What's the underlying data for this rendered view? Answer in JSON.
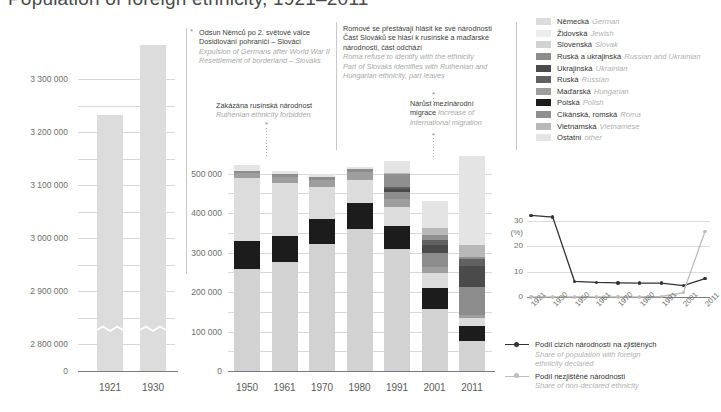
{
  "title": "Population of foreign ethnicity, 1921–2011",
  "left_chart": {
    "y_ticks": [
      "3 300 000",
      "3 200 000",
      "3 100 000",
      "3 000 000",
      "2 900 000",
      "2 800 000",
      "0"
    ],
    "x_ticks": [
      "1921",
      "1930"
    ]
  },
  "middle_chart": {
    "y_ticks": [
      "500 000",
      "400 000",
      "300 000",
      "200 000",
      "100 000",
      "0"
    ],
    "x_ticks": [
      "1950",
      "1961",
      "1970",
      "1980",
      "1991",
      "2001",
      "2011"
    ]
  },
  "annotations": [
    {
      "id": "expulsion",
      "cs": [
        "Odsun Němců po 2. světové válce",
        "Dosidlování pohraničí – Slováci"
      ],
      "en": [
        "Expulsion of Germans after World War II",
        "Resettlement of borderland – Slovaks"
      ]
    },
    {
      "id": "ruthenian",
      "cs": [
        "Zakázána rusínská národnost"
      ],
      "en": [
        "Ruthenian ethnicity forbidden"
      ]
    },
    {
      "id": "roma-slovaks",
      "cs": [
        "Romové se přestávají hlásit ke své národnosti",
        "Část Slováků se hlásí k rusínské a maďarské",
        "národnosti, část odchází"
      ],
      "en": [
        "Roma refuse to identify with the ethnicity",
        "Part of Slovaks identifies with Ruthenian and",
        "Hungarian ethnicity, part leaves"
      ]
    },
    {
      "id": "migration",
      "cs": [
        "Nárůst mezinárodní"
      ],
      "cs2": "migrace",
      "en": [
        "Increase of",
        "international migration"
      ]
    }
  ],
  "ethnicity_legend": [
    {
      "cs": "Německá",
      "en": "German",
      "color": "#dcdcdc"
    },
    {
      "cs": "Židovská",
      "en": "Jewish",
      "color": "#ececec"
    },
    {
      "cs": "Slovenská",
      "en": "Slovak",
      "color": "#d2d2d2"
    },
    {
      "cs": "Ruská a ukrajinská",
      "en": "Russian and Ukrainian",
      "color": "#8c8c8c"
    },
    {
      "cs": "Ukrajinská",
      "en": "Ukrainian",
      "color": "#4a4a4a"
    },
    {
      "cs": "Ruská",
      "en": "Russian",
      "color": "#616161"
    },
    {
      "cs": "Maďarská",
      "en": "Hungarian",
      "color": "#9e9e9e"
    },
    {
      "cs": "Polská",
      "en": "Polish",
      "color": "#1c1c1c"
    },
    {
      "cs": "Cikánská, romská",
      "en": "Roma",
      "color": "#8f8f8f"
    },
    {
      "cs": "Vietnamská",
      "en": "Vietnamese",
      "color": "#b8b8b8"
    },
    {
      "cs": "Ostatní",
      "en": "other",
      "color": "#e4e4e4"
    }
  ],
  "line_chart": {
    "y_ticks": [
      "30",
      "20",
      "10",
      "0"
    ],
    "y_unit": "(%)",
    "x_ticks": [
      "1921",
      "1930",
      "1950",
      "1961",
      "1970",
      "1980",
      "1991",
      "2001",
      "2011"
    ],
    "legend": [
      {
        "cs": "Podíl cizích národností na zjištěných",
        "en": [
          "Share of population with foreign",
          "ethnicity declared"
        ],
        "color": "#333333"
      },
      {
        "cs": "Podíl nezjištěné národnosti",
        "en": [
          "Share of non-declared ethnicity"
        ],
        "color": "#bdbdbd"
      }
    ]
  },
  "chart_data": [
    {
      "type": "bar",
      "id": "left-stacked-bars",
      "title": "Population of foreign ethnicity, 1921–1930",
      "xlabel": "",
      "ylabel": "",
      "ylim": [
        2750000,
        3370000
      ],
      "axis_break": true,
      "grid": true,
      "categories": [
        "1921",
        "1930"
      ],
      "stack_order": [
        "Ostatní",
        "Vietnamská",
        "Cikánská, romská",
        "Polská",
        "Maďarská",
        "Ruská",
        "Ukrajinská",
        "Ruská a ukrajinská",
        "Slovenská",
        "Židovská",
        "Německá"
      ],
      "series": [
        {
          "name": "Ostatní",
          "values": [
            3063000,
            3150000
          ]
        },
        {
          "name": "Vietnamská",
          "values": [
            0,
            0
          ]
        },
        {
          "name": "Cikánská, romská",
          "values": [
            1000,
            1500
          ]
        },
        {
          "name": "Polská",
          "values": [
            104000,
            93000
          ]
        },
        {
          "name": "Maďarská",
          "values": [
            8000,
            12000
          ]
        },
        {
          "name": "Ruská",
          "values": [
            0,
            0
          ]
        },
        {
          "name": "Ukrajinská",
          "values": [
            0,
            0
          ]
        },
        {
          "name": "Ruská a ukrajinská",
          "values": [
            14000,
            23000
          ]
        },
        {
          "name": "Slovenská",
          "values": [
            16000,
            44000
          ]
        },
        {
          "name": "Židovská",
          "values": [
            11000,
            10000
          ]
        },
        {
          "name": "Německá",
          "values": [
            3123000,
            3150000
          ]
        }
      ],
      "totals": [
        3232000,
        3365000
      ]
    },
    {
      "type": "bar",
      "id": "middle-stacked-bars",
      "title": "Population of foreign ethnicity, 1950–2011",
      "xlabel": "",
      "ylabel": "",
      "ylim": [
        0,
        560000
      ],
      "grid": true,
      "categories": [
        "1950",
        "1961",
        "1970",
        "1980",
        "1991",
        "2001",
        "2011"
      ],
      "totals": [
        521000,
        508000,
        500000,
        517000,
        532000,
        432000,
        546000
      ],
      "series": [
        {
          "name": "Slovenská",
          "values": [
            258000,
            276000,
            321000,
            360000,
            314000,
            193000,
            147000
          ]
        },
        {
          "name": "Polská",
          "values": [
            71000,
            67000,
            64000,
            66000,
            60000,
            52000,
            39000
          ]
        },
        {
          "name": "Německá",
          "values": [
            160000,
            134000,
            81000,
            58000,
            48000,
            39000,
            19000
          ]
        },
        {
          "name": "Maďarská",
          "values": [
            13000,
            15000,
            19000,
            20000,
            20000,
            14000,
            9000
          ]
        },
        {
          "name": "Ruská a ukrajinská",
          "values": [
            6000,
            7000,
            7000,
            7000,
            18000,
            35000,
            70000
          ]
        },
        {
          "name": "Ukrajinská",
          "values": [
            0,
            0,
            0,
            0,
            8000,
            22000,
            53000
          ]
        },
        {
          "name": "Ruská",
          "values": [
            0,
            0,
            0,
            0,
            5000,
            13000,
            18000
          ]
        },
        {
          "name": "Cikánská, romská",
          "values": [
            0,
            0,
            0,
            0,
            33000,
            12000,
            5000
          ]
        },
        {
          "name": "Vietnamská",
          "values": [
            0,
            0,
            0,
            0,
            400,
            18000,
            30000
          ]
        },
        {
          "name": "Ostatní",
          "values": [
            13000,
            9000,
            8000,
            6000,
            30000,
            69000,
            227000
          ]
        }
      ]
    },
    {
      "type": "line",
      "id": "share-line-chart",
      "title": "",
      "xlabel": "",
      "ylabel": "(%)",
      "ylim": [
        0,
        34
      ],
      "grid": true,
      "x": [
        "1921",
        "1930",
        "1950",
        "1961",
        "1970",
        "1980",
        "1991",
        "2001",
        "2011"
      ],
      "series": [
        {
          "name": "Podíl cizích národností na zjištěných",
          "values": [
            32.3,
            31.6,
            6.2,
            5.8,
            5.6,
            5.5,
            5.5,
            4.5,
            7.3
          ],
          "color": "#333333"
        },
        {
          "name": "Podíl nezjištěné národnosti",
          "values": [
            0.05,
            0.05,
            0.05,
            0.05,
            0.05,
            0.05,
            0.2,
            1.7,
            25.9
          ],
          "color": "#bdbdbd"
        }
      ]
    }
  ]
}
